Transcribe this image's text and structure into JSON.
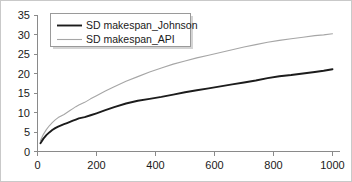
{
  "chart_data": {
    "type": "line",
    "title": "",
    "xlabel": "",
    "ylabel": "",
    "xlim": [
      0,
      1000
    ],
    "ylim": [
      0,
      35
    ],
    "grid": false,
    "legend_position": "top-left",
    "xticks": [
      "0",
      "200",
      "400",
      "600",
      "800",
      "1000"
    ],
    "xtick_values": [
      0,
      200,
      400,
      600,
      800,
      1000
    ],
    "yticks": [
      "0",
      "5",
      "10",
      "15",
      "20",
      "25",
      "30",
      "35"
    ],
    "ytick_values": [
      0,
      5,
      10,
      15,
      20,
      25,
      30,
      35
    ],
    "series": [
      {
        "name": "SD makespan_Johnson",
        "color": "#1c1c1c",
        "width": 1.9,
        "x": [
          10,
          20,
          30,
          40,
          50,
          60,
          70,
          80,
          90,
          100,
          110,
          120,
          130,
          140,
          160,
          180,
          200,
          230,
          260,
          300,
          340,
          380,
          420,
          460,
          500,
          540,
          580,
          620,
          660,
          700,
          740,
          780,
          820,
          860,
          900,
          940,
          970,
          1000
        ],
        "values": [
          2.1,
          3.3,
          4.2,
          4.9,
          5.5,
          6.0,
          6.4,
          6.7,
          7.0,
          7.3,
          7.6,
          7.9,
          8.2,
          8.5,
          8.8,
          9.3,
          9.8,
          10.6,
          11.4,
          12.3,
          13.0,
          13.5,
          14.0,
          14.6,
          15.2,
          15.7,
          16.2,
          16.7,
          17.2,
          17.7,
          18.2,
          18.8,
          19.3,
          19.6,
          20.0,
          20.4,
          20.7,
          21.1
        ]
      },
      {
        "name": "SD makespan_API",
        "color": "#a6a6a6",
        "width": 1.1,
        "x": [
          10,
          20,
          30,
          40,
          50,
          60,
          70,
          80,
          90,
          100,
          110,
          120,
          130,
          140,
          160,
          180,
          200,
          230,
          260,
          300,
          340,
          380,
          420,
          460,
          500,
          540,
          580,
          620,
          660,
          700,
          740,
          780,
          820,
          860,
          900,
          940,
          970,
          1000
        ],
        "values": [
          2.8,
          4.4,
          5.6,
          6.6,
          7.4,
          8.1,
          8.7,
          9.1,
          9.5,
          10.0,
          10.5,
          11.0,
          11.5,
          11.9,
          12.6,
          13.5,
          14.3,
          15.5,
          16.6,
          18.0,
          19.2,
          20.4,
          21.4,
          22.4,
          23.2,
          24.0,
          24.7,
          25.4,
          26.1,
          26.8,
          27.4,
          28.0,
          28.5,
          28.9,
          29.3,
          29.7,
          29.9,
          30.2
        ]
      }
    ]
  },
  "legend": {
    "entries": [
      {
        "label": "SD makespan_Johnson",
        "swatch": "line-swatch-dark"
      },
      {
        "label": "SD makespan_API",
        "swatch": "line-swatch-light"
      }
    ]
  }
}
